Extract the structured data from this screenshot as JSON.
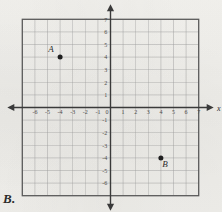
{
  "choice": {
    "label": "B."
  },
  "figure": {
    "x_axis_name": "x",
    "grid": {
      "x_min": -7,
      "x_max": 7,
      "y_min": -7,
      "y_max": 7,
      "cell_px": 12.6,
      "origin_px_x": 110.5,
      "origin_px_y": 107.5,
      "grid_color": "#9a9a9a",
      "frame_color": "#5a5a5a",
      "axis_color": "#3a3a3a"
    },
    "x_tick_labels": [
      "-6",
      "-5",
      "-4",
      "-3",
      "-2",
      "-1",
      "0",
      "1",
      "2",
      "3",
      "4",
      "5",
      "6",
      "7"
    ],
    "x_tick_values": [
      -6,
      -5,
      -4,
      -3,
      -2,
      -1,
      0,
      1,
      2,
      3,
      4,
      5,
      6,
      7
    ],
    "y_tick_labels": [
      "7",
      "6",
      "5",
      "4",
      "3",
      "2",
      "1",
      "-1",
      "-2",
      "-3",
      "-4",
      "-5",
      "-6"
    ],
    "y_tick_values": [
      7,
      6,
      5,
      4,
      3,
      2,
      1,
      -1,
      -2,
      -3,
      -4,
      -5,
      -6
    ],
    "points": [
      {
        "name": "A",
        "x": -4,
        "y": 4,
        "label_dx": -9,
        "label_dy": -5
      },
      {
        "name": "B",
        "x": 4,
        "y": -4,
        "label_dx": 4,
        "label_dy": 9
      }
    ]
  },
  "chart_data": {
    "type": "scatter",
    "title": "",
    "xlabel": "x",
    "ylabel": "",
    "xlim": [
      -7,
      7
    ],
    "ylim": [
      -7,
      7
    ],
    "grid": true,
    "legend": "none",
    "xticks": [
      -6,
      -5,
      -4,
      -3,
      -2,
      -1,
      0,
      1,
      2,
      3,
      4,
      5,
      6,
      7
    ],
    "yticks": [
      -6,
      -5,
      -4,
      -3,
      -2,
      -1,
      1,
      2,
      3,
      4,
      5,
      6,
      7
    ],
    "points": [
      {
        "label": "A",
        "x": -4,
        "y": 4
      },
      {
        "label": "B",
        "x": 4,
        "y": -4
      }
    ]
  }
}
